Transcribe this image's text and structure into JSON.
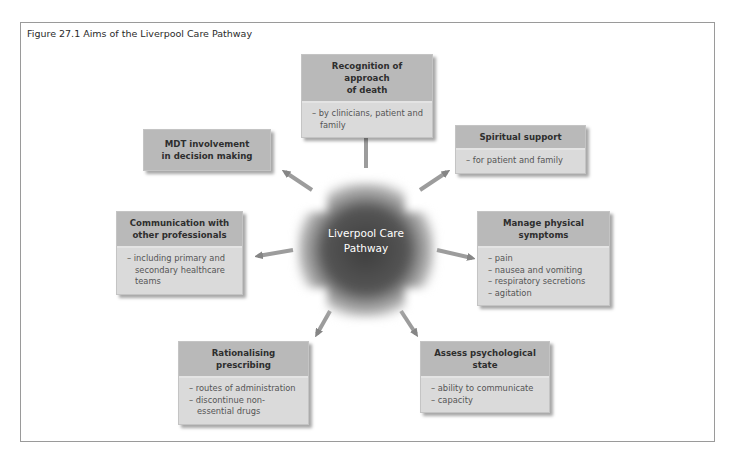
{
  "figure": {
    "title": "Figure 27.1   Aims of the Liverpool Care Pathway"
  },
  "center": {
    "line1": "Liverpool Care",
    "line2": "Pathway"
  },
  "boxes": {
    "recognition": {
      "heading_line1": "Recognition of approach",
      "heading_line2": "of death",
      "items": [
        "– by clinicians, patient and family"
      ]
    },
    "mdt": {
      "heading_line1": "MDT involvement",
      "heading_line2": "in decision making"
    },
    "spiritual": {
      "heading_line1": "Spiritual support",
      "items": [
        "– for patient and family"
      ]
    },
    "communication": {
      "heading_line1": "Communication with",
      "heading_line2": "other professionals",
      "items": [
        "– including primary and secondary healthcare teams"
      ]
    },
    "physical": {
      "heading_line1": "Manage physical",
      "heading_line2": "symptoms",
      "items": [
        "– pain",
        "– nausea and vomiting",
        "– respiratory secretions",
        "– agitation"
      ]
    },
    "prescribing": {
      "heading_line1": "Rationalising prescribing",
      "items": [
        "– routes of administration",
        "– discontinue non-essential drugs"
      ]
    },
    "psychological": {
      "heading_line1": "Assess psychological",
      "heading_line2": "state",
      "items": [
        "– ability to communicate",
        "– capacity"
      ]
    }
  },
  "colors": {
    "header_fill": "#b9b9b9",
    "body_fill": "#dadada",
    "center_fill": "#4a4a4a",
    "arrow": "#8a8a8a"
  }
}
